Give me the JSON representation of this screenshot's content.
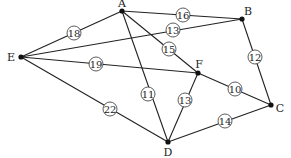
{
  "diagram": {
    "type": "weighted-graph",
    "nodes": [
      {
        "id": "A",
        "x": 122,
        "y": 11,
        "lx": 122,
        "ly": 3
      },
      {
        "id": "B",
        "x": 242,
        "y": 19,
        "lx": 248,
        "ly": 11
      },
      {
        "id": "E",
        "x": 21,
        "y": 57,
        "lx": 11,
        "ly": 57
      },
      {
        "id": "F",
        "x": 198,
        "y": 73,
        "lx": 199,
        "ly": 64
      },
      {
        "id": "C",
        "x": 271,
        "y": 105,
        "lx": 280,
        "ly": 108
      },
      {
        "id": "D",
        "x": 168,
        "y": 142,
        "lx": 168,
        "ly": 152
      }
    ],
    "edges": [
      {
        "from": "E",
        "to": "A",
        "weight": "18",
        "wx": 74,
        "wy": 33
      },
      {
        "from": "A",
        "to": "B",
        "weight": "16",
        "wx": 183,
        "wy": 15
      },
      {
        "from": "E",
        "to": "B",
        "weight": "13",
        "wx": 173,
        "wy": 30
      },
      {
        "from": "A",
        "to": "F",
        "weight": "15",
        "wx": 169,
        "wy": 49
      },
      {
        "from": "E",
        "to": "F",
        "weight": "19",
        "wx": 96,
        "wy": 64
      },
      {
        "from": "B",
        "to": "C",
        "weight": "12",
        "wx": 255,
        "wy": 57
      },
      {
        "from": "A",
        "to": "D",
        "weight": "11",
        "wx": 148,
        "wy": 94
      },
      {
        "from": "F",
        "to": "D",
        "weight": "13",
        "wx": 185,
        "wy": 100
      },
      {
        "from": "F",
        "to": "C",
        "weight": "10",
        "wx": 235,
        "wy": 89
      },
      {
        "from": "E",
        "to": "D",
        "weight": "22",
        "wx": 110,
        "wy": 109
      },
      {
        "from": "D",
        "to": "C",
        "weight": "14",
        "wx": 225,
        "wy": 121
      }
    ]
  }
}
